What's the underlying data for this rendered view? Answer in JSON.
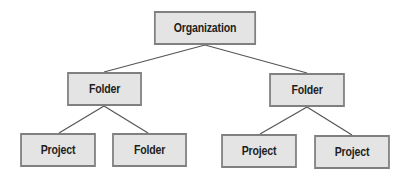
{
  "diagram": {
    "type": "hierarchy-tree",
    "colors": {
      "node_fill": "#e4e4e4",
      "node_border": "#808080",
      "edge": "#555555",
      "text": "#1e1e1e"
    },
    "nodes": [
      {
        "id": "org",
        "label": "Organization",
        "x": 147,
        "y": 11,
        "w": 116,
        "h": 34
      },
      {
        "id": "folder_left",
        "label": "Folder",
        "x": 62,
        "y": 72,
        "w": 85,
        "h": 34
      },
      {
        "id": "folder_right",
        "label": "Folder",
        "x": 264,
        "y": 73,
        "w": 86,
        "h": 34
      },
      {
        "id": "project_1",
        "label": "Project",
        "x": 15,
        "y": 133,
        "w": 86,
        "h": 34
      },
      {
        "id": "folder_sub",
        "label": "Folder",
        "x": 107,
        "y": 133,
        "w": 85,
        "h": 34
      },
      {
        "id": "project_2",
        "label": "Project",
        "x": 216,
        "y": 134,
        "w": 86,
        "h": 34
      },
      {
        "id": "project_3",
        "label": "Project",
        "x": 309,
        "y": 135,
        "w": 86,
        "h": 34
      }
    ],
    "edges": [
      {
        "from": "org",
        "to": "folder_left"
      },
      {
        "from": "org",
        "to": "folder_right"
      },
      {
        "from": "folder_left",
        "to": "project_1"
      },
      {
        "from": "folder_left",
        "to": "folder_sub"
      },
      {
        "from": "folder_right",
        "to": "project_2"
      },
      {
        "from": "folder_right",
        "to": "project_3"
      }
    ]
  }
}
